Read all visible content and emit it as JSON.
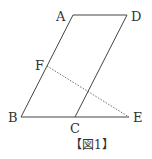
{
  "diagram": {
    "caption": "【図1】",
    "points": {
      "A": {
        "label": "A",
        "x": 73,
        "y": 15
      },
      "D": {
        "label": "D",
        "x": 127,
        "y": 15
      },
      "B": {
        "label": "B",
        "x": 21,
        "y": 117
      },
      "C": {
        "label": "C",
        "x": 75,
        "y": 117
      },
      "E": {
        "label": "E",
        "x": 129,
        "y": 117
      },
      "F": {
        "label": "F",
        "x": 47,
        "y": 66
      }
    },
    "segments": [
      {
        "from": "A",
        "to": "D",
        "style": "solid"
      },
      {
        "from": "A",
        "to": "B",
        "style": "solid"
      },
      {
        "from": "D",
        "to": "C",
        "style": "solid"
      },
      {
        "from": "B",
        "to": "E",
        "style": "solid"
      },
      {
        "from": "F",
        "to": "E",
        "style": "dotted"
      }
    ],
    "colors": {
      "line": "#444444",
      "text": "#333333"
    }
  }
}
